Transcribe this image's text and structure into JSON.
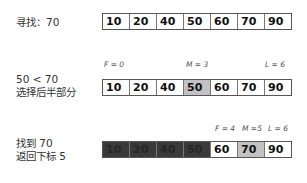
{
  "rows": [
    {
      "label_lines": [
        "寻找：70"
      ],
      "values": [
        "10",
        "20",
        "40",
        "50",
        "60",
        "70",
        "90"
      ],
      "states": [
        "normal",
        "normal",
        "normal",
        "normal",
        "normal",
        "normal",
        "normal"
      ]
    },
    {
      "label_lines": [
        "50 < 70",
        "选择后半部分"
      ],
      "pointers": {
        "f": "F = 0",
        "m": "M = 3",
        "l": "L = 6"
      },
      "values": [
        "10",
        "20",
        "40",
        "50",
        "60",
        "70",
        "90"
      ],
      "states": [
        "normal",
        "normal",
        "normal",
        "mid",
        "normal",
        "normal",
        "normal"
      ]
    },
    {
      "label_lines": [
        "找到 70",
        "返回下标 5"
      ],
      "pointers": {
        "f": "F = 4",
        "m": "M =5",
        "l": "L = 6"
      },
      "values": [
        "10",
        "20",
        "40",
        "50",
        "60",
        "70",
        "90"
      ],
      "states": [
        "dark",
        "dark",
        "dark",
        "dark",
        "normal",
        "mid",
        "normal"
      ]
    }
  ],
  "colors": {
    "mid": "#c2c2c2",
    "discarded": "#3a3a3a",
    "border": "#555555"
  }
}
